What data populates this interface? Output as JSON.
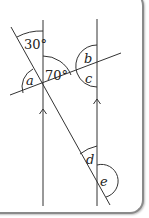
{
  "diagram": {
    "type": "parallel-lines-angles",
    "angles": {
      "top_angle": "30°",
      "given_angle": "70°",
      "a": "a",
      "b": "b",
      "c": "c",
      "d": "d",
      "e": "e"
    },
    "colors": {
      "line": "#333333",
      "border": "#8a8a8a",
      "background": "#ffffff"
    }
  }
}
